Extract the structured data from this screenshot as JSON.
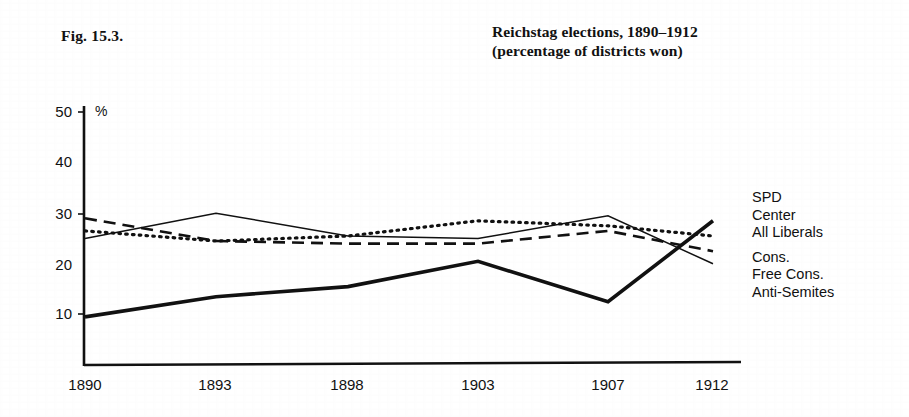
{
  "figure": {
    "label": "Fig. 15.3.",
    "title_line1": "Reichstag elections, 1890–1912",
    "title_line2": "(percentage of districts won)"
  },
  "axes": {
    "y_unit": "%",
    "y_ticks": [
      "50",
      "40",
      "30",
      "20",
      "10"
    ],
    "x_ticks": [
      "1890",
      "1893",
      "1898",
      "1903",
      "1907",
      "1912"
    ]
  },
  "legend": {
    "entries": [
      {
        "label": "SPD",
        "style": "thick-solid"
      },
      {
        "label": "Center",
        "style": "dotted"
      },
      {
        "label": "All Liberals",
        "style": "dashed"
      },
      {
        "label": "Cons.",
        "style": "thin-solid"
      },
      {
        "label": "Free Cons.",
        "style": "thin-solid"
      },
      {
        "label": "Anti-Semites",
        "style": "thin-solid"
      }
    ]
  },
  "colors": {
    "ink": "#111111",
    "background": "#ffffff"
  },
  "chart_data": {
    "type": "line",
    "title": "Reichstag elections, 1890–1912 (percentage of districts won)",
    "xlabel": "",
    "ylabel": "%",
    "x": [
      "1890",
      "1893",
      "1898",
      "1903",
      "1907",
      "1912"
    ],
    "ylim": [
      0,
      50
    ],
    "xlim_labels": [
      "1890",
      "1912"
    ],
    "y_ticks": [
      10,
      20,
      30,
      40,
      50
    ],
    "grid": false,
    "legend_position": "right",
    "series": [
      {
        "name": "SPD",
        "style": "thick-solid",
        "values": [
          9.5,
          13.5,
          15.5,
          20.5,
          12.5,
          28.5
        ]
      },
      {
        "name": "Center",
        "style": "dotted",
        "values": [
          26.5,
          24.5,
          25.5,
          28.5,
          27.5,
          25.5
        ]
      },
      {
        "name": "All Liberals",
        "style": "dashed",
        "values": [
          29.0,
          24.5,
          24.0,
          24.0,
          26.5,
          22.5
        ]
      },
      {
        "name": "Cons., Free Cons., Anti-Semites",
        "style": "thin-solid",
        "values": [
          25.0,
          30.0,
          25.5,
          25.0,
          29.5,
          20.0
        ]
      }
    ]
  }
}
